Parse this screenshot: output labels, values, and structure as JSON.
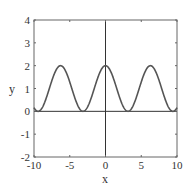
{
  "chart_data": {
    "type": "line",
    "title": "",
    "xlabel": "x",
    "ylabel": "y",
    "xlim": [
      -10,
      10
    ],
    "ylim": [
      -2,
      4
    ],
    "xticks": [
      -10,
      -5,
      0,
      5,
      10
    ],
    "yticks": [
      -2,
      -1,
      0,
      1,
      2,
      3,
      4
    ],
    "xtick_labels": [
      "-10",
      "-5",
      "0",
      "5",
      "10"
    ],
    "ytick_labels": [
      "-2",
      "-1",
      "0",
      "1",
      "2",
      "3",
      "4"
    ],
    "grid": false,
    "legend": null,
    "series": [
      {
        "name": "y = 1 + cos(x)",
        "color": "#555555",
        "x": [
          -10,
          -9.42,
          -8,
          -6.28,
          -4.5,
          -3.14,
          -2,
          -1,
          0,
          1,
          2,
          3.14,
          4.5,
          6.28,
          8,
          9.42,
          10
        ],
        "y": [
          0.16,
          0.0,
          0.85,
          2.0,
          0.79,
          0.0,
          0.58,
          1.54,
          2.0,
          1.54,
          0.58,
          0.0,
          0.79,
          2.0,
          0.85,
          0.0,
          0.16
        ]
      }
    ],
    "reference_lines": [
      {
        "axis": "x",
        "value": 0
      },
      {
        "axis": "y",
        "value": 0
      }
    ]
  }
}
